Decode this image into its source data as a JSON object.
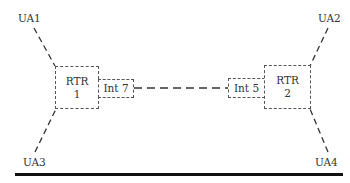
{
  "diagram": {
    "user_agents": [
      {
        "id": "ua1",
        "label": "UA1"
      },
      {
        "id": "ua2",
        "label": "UA2"
      },
      {
        "id": "ua3",
        "label": "UA3"
      },
      {
        "id": "ua4",
        "label": "UA4"
      }
    ],
    "routers": [
      {
        "id": "rtr1",
        "line1": "RTR",
        "line2": "1"
      },
      {
        "id": "rtr2",
        "line1": "RTR",
        "line2": "2"
      }
    ],
    "interfaces": [
      {
        "id": "int7",
        "label": "Int 7"
      },
      {
        "id": "int5",
        "label": "Int 5"
      }
    ],
    "links": [
      {
        "from": "UA1",
        "to": "RTR 1",
        "style": "dashed"
      },
      {
        "from": "UA3",
        "to": "RTR 1",
        "style": "dashed"
      },
      {
        "from": "UA2",
        "to": "RTR 2",
        "style": "dashed"
      },
      {
        "from": "UA4",
        "to": "RTR 2",
        "style": "dashed"
      },
      {
        "from": "Int 7",
        "to": "Int 5",
        "style": "dashed"
      }
    ],
    "colors": {
      "line": "#333333",
      "rule": "#111111",
      "background": "#ffffff"
    }
  }
}
